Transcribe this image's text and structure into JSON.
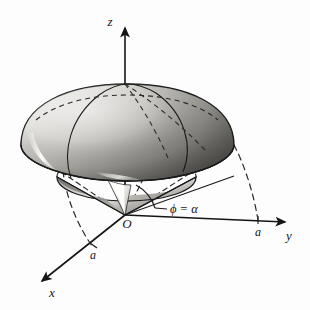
{
  "figure": {
    "background_color": "#fdfdfd",
    "ink_color": "#151515"
  },
  "axes": {
    "z": {
      "label": "z",
      "icon": "arrow-up-icon"
    },
    "y": {
      "label": "y",
      "icon": "arrow-right-icon"
    },
    "x": {
      "label": "x",
      "icon": "arrow-down-left-icon"
    }
  },
  "ticks": {
    "y_tick": "a",
    "x_tick": "a"
  },
  "origin": {
    "label": "O"
  },
  "annotations": {
    "angle": "ϕ = α"
  },
  "colors": {
    "dome_light": "#f2f1ef",
    "dome_mid": "#b9b7b2",
    "dome_dark": "#6b6965",
    "cone_light": "#ffffff",
    "cone_mid": "#a9a7a3",
    "cone_dark": "#6f6d69",
    "outline": "#1a1a1a",
    "dashed": "#2a2a2a"
  }
}
